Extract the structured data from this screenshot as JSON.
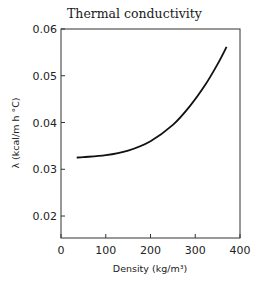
{
  "chart_data": {
    "type": "line",
    "title": "Thermal conductivity",
    "xlabel": "Density (kg/m³)",
    "ylabel": "λ (kcal/m h °C)",
    "xlim": [
      0,
      400
    ],
    "ylim": [
      0.0153,
      0.06
    ],
    "xticks": [
      0,
      100,
      200,
      300,
      400
    ],
    "xtick_labels": [
      "0",
      "100",
      "200",
      "300",
      "400"
    ],
    "yticks": [
      0.02,
      0.03,
      0.04,
      0.05,
      0.06
    ],
    "ytick_labels": [
      "0.02",
      "0.03",
      "0.04",
      "0.05",
      "0.06"
    ],
    "grid": false,
    "series": [
      {
        "name": "Thermal conductivity",
        "x": [
          35,
          50,
          100,
          150,
          200,
          250,
          288,
          322,
          350,
          370
        ],
        "y": [
          0.0325,
          0.0326,
          0.033,
          0.034,
          0.036,
          0.0395,
          0.0435,
          0.048,
          0.0525,
          0.0562
        ]
      }
    ]
  }
}
